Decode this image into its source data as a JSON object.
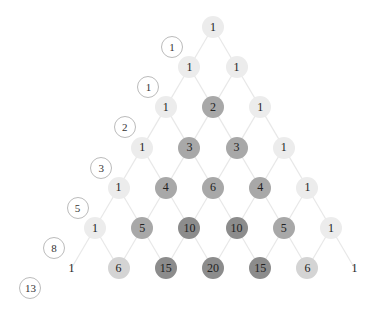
{
  "diagram": {
    "title": "",
    "type": "pascal-triangle-with-fibonacci-diagonals",
    "colors": {
      "line": "#e8e8e8",
      "shade_1": "#ececec",
      "shade_low": "#d4d4d4",
      "shade_mid": "#a8a8a8",
      "shade_high": "#8c8c8c",
      "fib_border": "#bbbbbb"
    },
    "rows": [
      [
        "1"
      ],
      [
        "1",
        "1"
      ],
      [
        "1",
        "2",
        "1"
      ],
      [
        "1",
        "3",
        "3",
        "1"
      ],
      [
        "1",
        "4",
        "6",
        "4",
        "1"
      ],
      [
        "1",
        "5",
        "10",
        "10",
        "5",
        "1"
      ],
      [
        "1",
        "6",
        "15",
        "20",
        "15",
        "6",
        "1"
      ]
    ],
    "fibonacci": [
      "1",
      "1",
      "2",
      "3",
      "5",
      "8",
      "13"
    ]
  }
}
